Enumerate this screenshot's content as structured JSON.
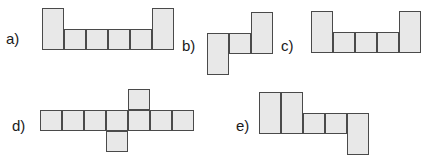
{
  "figure": {
    "background_color": "#ffffff",
    "cell_fill_color": "#e8e8e8",
    "cell_border_color": "#4a4a4a",
    "label_color": "#1a1a1a",
    "cell_size": 22
  },
  "shapes": [
    {
      "id": "a",
      "label": "a)",
      "label_x": 6,
      "label_y": 31,
      "cell_count": 6,
      "description": "U-shape: two tall end columns with four squares between them",
      "cells": [
        {
          "x": 42,
          "y": 8,
          "w": 22,
          "h": 42
        },
        {
          "x": 64,
          "y": 29,
          "w": 22,
          "h": 21
        },
        {
          "x": 86,
          "y": 29,
          "w": 22,
          "h": 21
        },
        {
          "x": 108,
          "y": 29,
          "w": 22,
          "h": 21
        },
        {
          "x": 130,
          "y": 29,
          "w": 22,
          "h": 21
        },
        {
          "x": 152,
          "y": 8,
          "w": 22,
          "h": 42
        }
      ]
    },
    {
      "id": "b",
      "label": "b)",
      "label_x": 182,
      "label_y": 38,
      "cell_count": 3,
      "description": "Z-shape: tall left column, one middle square, tall right column raised",
      "cells": [
        {
          "x": 207,
          "y": 33,
          "w": 22,
          "h": 42
        },
        {
          "x": 229,
          "y": 33,
          "w": 22,
          "h": 21
        },
        {
          "x": 251,
          "y": 12,
          "w": 22,
          "h": 42
        }
      ]
    },
    {
      "id": "c",
      "label": "c)",
      "label_x": 281,
      "label_y": 38,
      "cell_count": 5,
      "description": "U-shape: two tall end columns with three squares between them",
      "cells": [
        {
          "x": 311,
          "y": 11,
          "w": 22,
          "h": 42
        },
        {
          "x": 333,
          "y": 32,
          "w": 22,
          "h": 21
        },
        {
          "x": 355,
          "y": 32,
          "w": 22,
          "h": 21
        },
        {
          "x": 377,
          "y": 32,
          "w": 22,
          "h": 21
        },
        {
          "x": 399,
          "y": 11,
          "w": 22,
          "h": 42
        }
      ]
    },
    {
      "id": "d",
      "label": "d)",
      "label_x": 12,
      "label_y": 118,
      "cell_count": 9,
      "description": "Cross/offset-T shape: horizontal row of seven squares with one square above column five and one square below column four",
      "cells": [
        {
          "x": 40,
          "y": 110,
          "w": 22,
          "h": 21
        },
        {
          "x": 62,
          "y": 110,
          "w": 22,
          "h": 21
        },
        {
          "x": 84,
          "y": 110,
          "w": 22,
          "h": 21
        },
        {
          "x": 106,
          "y": 110,
          "w": 22,
          "h": 21
        },
        {
          "x": 128,
          "y": 110,
          "w": 22,
          "h": 21
        },
        {
          "x": 150,
          "y": 110,
          "w": 22,
          "h": 21
        },
        {
          "x": 172,
          "y": 110,
          "w": 22,
          "h": 21
        },
        {
          "x": 128,
          "y": 89,
          "w": 22,
          "h": 21
        },
        {
          "x": 106,
          "y": 131,
          "w": 22,
          "h": 21
        }
      ]
    },
    {
      "id": "e",
      "label": "e)",
      "label_x": 236,
      "label_y": 118,
      "cell_count": 5,
      "description": "Staircase shape: two tall left columns, two squares at mid height, one tall right column dropping down",
      "cells": [
        {
          "x": 259,
          "y": 92,
          "w": 22,
          "h": 42
        },
        {
          "x": 281,
          "y": 92,
          "w": 22,
          "h": 42
        },
        {
          "x": 303,
          "y": 113,
          "w": 22,
          "h": 21
        },
        {
          "x": 325,
          "y": 113,
          "w": 22,
          "h": 21
        },
        {
          "x": 347,
          "y": 113,
          "w": 22,
          "h": 42
        }
      ]
    }
  ]
}
